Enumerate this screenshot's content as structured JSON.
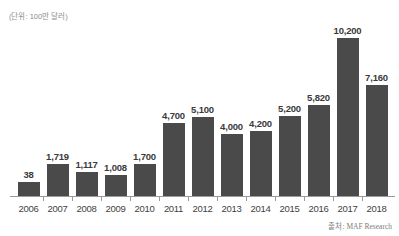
{
  "chart_data": {
    "type": "bar",
    "title": "",
    "subtitle": "",
    "unit_note": "(단위: 100만 달러)",
    "source_note": "출처: MAF Research",
    "xlabel": "",
    "ylabel": "",
    "grid": false,
    "legend": "none",
    "axis_min": 0,
    "axis_max": 11000,
    "bar_color": "#4a4a4a",
    "axis_color": "#9a9a9a",
    "label_color": "#3a3a3a",
    "categories": [
      "2006",
      "2007",
      "2008",
      "2009",
      "2010",
      "2011",
      "2012",
      "2013",
      "2014",
      "2015",
      "2016",
      "2017",
      "2018"
    ],
    "values": [
      38,
      1719,
      1117,
      1008,
      1700,
      4700,
      5100,
      4000,
      4200,
      5200,
      5820,
      10200,
      7160
    ],
    "value_labels": [
      "38",
      "1,719",
      "1,117",
      "1,008",
      "1,700",
      "4,700",
      "5,100",
      "4,000",
      "4,200",
      "5,200",
      "5,820",
      "10,200",
      "7,160"
    ],
    "bar_pixel_heights": [
      14,
      32,
      24,
      21,
      32,
      73,
      79,
      62,
      65,
      80,
      91,
      158,
      111
    ]
  }
}
